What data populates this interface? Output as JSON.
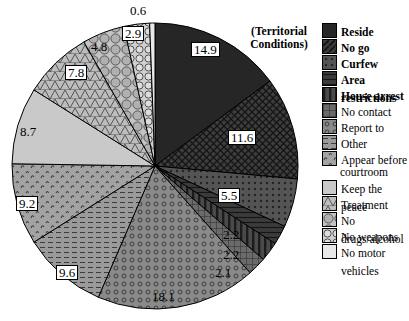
{
  "legend": {
    "title_line1": "(Territorial",
    "title_line2": "Conditions)",
    "items": [
      {
        "label": "Reside",
        "bold": true,
        "swatch": "solid-dark"
      },
      {
        "label": "No go",
        "bold": true,
        "swatch": "diag-dark"
      },
      {
        "label": "Curfew",
        "bold": true,
        "swatch": "dot-dark"
      },
      {
        "label": "Area restrictions",
        "bold": true,
        "swatch": "crosshatch-dark"
      },
      {
        "label": "House arrest",
        "bold": true,
        "swatch": "vertical-dark"
      },
      {
        "label": "No contact",
        "bold": false,
        "swatch": "vertical-mid"
      },
      {
        "label": "Report to",
        "bold": false,
        "swatch": "ring-mid"
      },
      {
        "label": "Other",
        "bold": false,
        "swatch": "hline-mid"
      },
      {
        "label": "Appear before",
        "label2": "courtroom",
        "bold": false,
        "swatch": "squig-mid"
      },
      {
        "label": "Keep the peace",
        "bold": false,
        "swatch": "plain-light"
      },
      {
        "label": "Treatment",
        "bold": false,
        "swatch": "tri-light"
      },
      {
        "label": "No drugs/alcohol",
        "bold": false,
        "swatch": "circle-light"
      },
      {
        "label": "No weapons",
        "bold": false,
        "swatch": "bigcircle-light"
      },
      {
        "label": "No motor vehicles",
        "bold": false,
        "swatch": "plain-white"
      }
    ]
  },
  "chart_data": {
    "type": "pie",
    "title": "",
    "legend_position": "right",
    "start_angle_deg": 0,
    "direction": "clockwise",
    "categories": [
      "Reside",
      "No go",
      "Curfew",
      "Area restrictions",
      "House arrest",
      "No contact",
      "Report to",
      "Other",
      "Appear before courtroom",
      "Keep the peace",
      "Treatment",
      "No drugs/alcohol",
      "No weapons",
      "No motor vehicles"
    ],
    "values": [
      14.9,
      11.6,
      5.5,
      2.2,
      2.2,
      2.1,
      18.1,
      9.6,
      9.2,
      8.7,
      7.8,
      4.8,
      2.9,
      0.6
    ],
    "value_labels": [
      "14.9",
      "11.6",
      "5.5",
      "2.2",
      "2.2",
      "2.1",
      "18.1",
      "9.6",
      "9.2",
      "8.7",
      "7.8",
      "4.8",
      "2.9",
      "0.6"
    ],
    "units": "percent"
  },
  "labels": [
    {
      "text": "14.9",
      "x": 191,
      "y": 42,
      "boxed": true
    },
    {
      "text": "11.6",
      "x": 228,
      "y": 130,
      "boxed": true
    },
    {
      "text": "5.5",
      "x": 218,
      "y": 188,
      "boxed": true
    },
    {
      "text": "2.2",
      "x": 223,
      "y": 228,
      "boxed": false
    },
    {
      "text": "2.2",
      "x": 223,
      "y": 248,
      "boxed": false
    },
    {
      "text": "2.1",
      "x": 215,
      "y": 266,
      "boxed": false
    },
    {
      "text": "18.1",
      "x": 152,
      "y": 290,
      "boxed": false
    },
    {
      "text": "9.6",
      "x": 56,
      "y": 265,
      "boxed": true
    },
    {
      "text": "9.2",
      "x": 16,
      "y": 196,
      "boxed": true
    },
    {
      "text": "8.7",
      "x": 20,
      "y": 125,
      "boxed": false
    },
    {
      "text": "7.8",
      "x": 65,
      "y": 65,
      "boxed": true
    },
    {
      "text": "4.8",
      "x": 91,
      "y": 40,
      "boxed": false
    },
    {
      "text": "2.9",
      "x": 122,
      "y": 26,
      "boxed": true
    },
    {
      "text": "0.6",
      "x": 130,
      "y": 4,
      "boxed": false
    }
  ]
}
